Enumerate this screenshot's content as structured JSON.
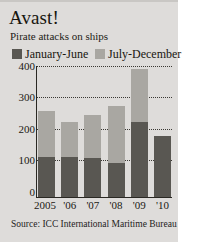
{
  "card": {
    "title": "Avast!",
    "subtitle": "Pirate attacks on ships",
    "source": "Source: ICC International Maritime Bureau"
  },
  "colors": {
    "background": "#dedcda",
    "page": "#ffffff",
    "series_jan_jun": "#595752",
    "series_jul_dec": "#a9a7a2",
    "text": "#1b1913",
    "axis": "#2a2823"
  },
  "legend": {
    "items": [
      {
        "label": "January-June",
        "color": "#595752"
      },
      {
        "label": "July-December",
        "color": "#a9a7a2"
      }
    ]
  },
  "axis": {
    "yticks": [
      "400",
      "300",
      "200",
      "100",
      "0"
    ],
    "xticks": [
      "2005",
      "'06",
      "'07",
      "'08",
      "'09",
      "'10"
    ]
  },
  "chart_data": {
    "type": "bar",
    "stacked": true,
    "title": "Avast!",
    "subtitle": "Pirate attacks on ships",
    "xlabel": "",
    "ylabel": "",
    "ylim": [
      0,
      420
    ],
    "yticks": [
      0,
      100,
      200,
      300,
      400
    ],
    "grid": "horizontal-dotted",
    "legend_position": "top",
    "source": "Source: ICC International Maritime Bureau",
    "categories": [
      "2005",
      "'06",
      "'07",
      "'08",
      "'09",
      "'10"
    ],
    "series": [
      {
        "name": "January-June",
        "color": "#595752",
        "values": [
          127,
          127,
          126,
          110,
          240,
          196
        ]
      },
      {
        "name": "July-December",
        "color": "#a9a7a2",
        "values": [
          149,
          113,
          137,
          183,
          170,
          0
        ]
      }
    ],
    "totals": [
      276,
      240,
      263,
      293,
      410,
      196
    ]
  }
}
